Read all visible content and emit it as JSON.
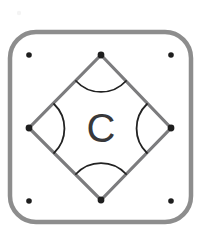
{
  "figure": {
    "name": "rounded-square-with-inscribed-diamond",
    "center_label": "C",
    "background_color": "#ffffff",
    "frame": {
      "name": "rounded-square-frame",
      "x": 10,
      "y": 32,
      "width": 181,
      "height": 190,
      "corner_radius": 26,
      "stroke_color": "#8d8d8d",
      "stroke_width": 4.5,
      "fill": "none"
    },
    "diamond": {
      "name": "inscribed-diamond",
      "stroke_color": "#7c7c7e",
      "stroke_width": 3.2,
      "fill": "none",
      "vertices": [
        {
          "name": "top-vertex",
          "x": 101,
          "y": 55
        },
        {
          "name": "right-vertex",
          "x": 171,
          "y": 128
        },
        {
          "name": "bottom-vertex",
          "x": 101,
          "y": 200
        },
        {
          "name": "left-vertex",
          "x": 29,
          "y": 128
        }
      ]
    },
    "vertex_dots": [
      {
        "name": "dot-top",
        "x": 101,
        "y": 55,
        "r": 3.4
      },
      {
        "name": "dot-right",
        "x": 171,
        "y": 128,
        "r": 3.4
      },
      {
        "name": "dot-bottom",
        "x": 101,
        "y": 200,
        "r": 3.4
      },
      {
        "name": "dot-left",
        "x": 29,
        "y": 128,
        "r": 3.4
      }
    ],
    "corner_dots": [
      {
        "name": "dot-corner-top-left",
        "x": 29,
        "y": 55,
        "r": 2.8
      },
      {
        "name": "dot-corner-top-right",
        "x": 171,
        "y": 55,
        "r": 2.8
      },
      {
        "name": "dot-corner-bottom-left",
        "x": 29,
        "y": 201,
        "r": 2.8
      },
      {
        "name": "dot-corner-bottom-right",
        "x": 171,
        "y": 201,
        "r": 2.8
      }
    ],
    "dot_color": "#1e1e1e",
    "angle_arcs": [
      {
        "name": "angle-arc-top",
        "path": "M 76 81 A 34 34 0 0 0 126 81",
        "stroke_color": "#222222",
        "stroke_width": 1.8
      },
      {
        "name": "angle-arc-right",
        "path": "M 147 104 A 34 34 0 0 0 147 153",
        "stroke_color": "#222222",
        "stroke_width": 1.8
      },
      {
        "name": "angle-arc-bottom",
        "path": "M 76 174 A 34 34 0 0 1 126 174",
        "stroke_color": "#222222",
        "stroke_width": 1.8
      },
      {
        "name": "angle-arc-left",
        "path": "M 54 104 A 34 34 0 0 1 54 153",
        "stroke_color": "#222222",
        "stroke_width": 1.8
      }
    ],
    "center_label_position": {
      "x": 101,
      "y": 142
    },
    "center_label_color": "#38383a",
    "artifact": {
      "name": "scan-speck",
      "x": 19,
      "y": 13,
      "r": 2.2,
      "color": "#f2f2f2"
    }
  }
}
